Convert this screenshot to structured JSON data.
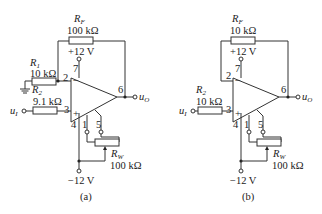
{
  "circuits": [
    {
      "id": "a",
      "caption": "(a)",
      "rf": {
        "name": "R",
        "sub": "F",
        "value": "100 kΩ"
      },
      "r1": {
        "name": "R",
        "sub": "1",
        "value": "10 kΩ"
      },
      "r2": {
        "name": "R",
        "sub": "2",
        "value": "9.1 kΩ"
      },
      "rw": {
        "name": "R",
        "sub": "W",
        "value": "100 kΩ"
      },
      "vpos": "+12 V",
      "vneg": "−12 V",
      "pins": {
        "p2": "2",
        "p3": "3",
        "p4": "4",
        "p1": "1",
        "p5": "5",
        "p6": "6",
        "p7": "7"
      },
      "input": {
        "name": "u",
        "sub": "I"
      },
      "output": {
        "name": "u",
        "sub": "O"
      }
    },
    {
      "id": "b",
      "caption": "(b)",
      "rf": {
        "name": "R",
        "sub": "F",
        "value": "10 kΩ"
      },
      "r2": {
        "name": "R",
        "sub": "2",
        "value": "10 kΩ"
      },
      "rw": {
        "name": "R",
        "sub": "W",
        "value": "100 kΩ"
      },
      "vpos": "+12 V",
      "vneg": "−12 V",
      "pins": {
        "p2": "2",
        "p3": "3",
        "p4": "4",
        "p1": "1",
        "p5": "5",
        "p6": "6",
        "p7": "7"
      },
      "input": {
        "name": "u",
        "sub": "I"
      },
      "output": {
        "name": "u",
        "sub": "O"
      }
    }
  ]
}
